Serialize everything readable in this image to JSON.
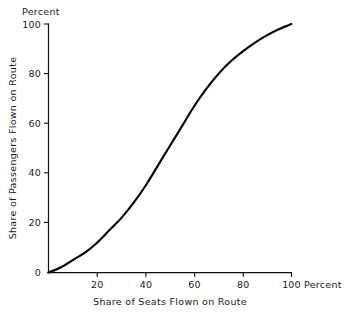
{
  "chart_data": {
    "type": "line",
    "title": "",
    "subtitle": "",
    "xlabel": "Share of Seats Flown on Route",
    "ylabel": "Share of Passengers Flown on Route",
    "x_unit_label": "Percent",
    "y_unit_label": "Percent",
    "xlim": [
      0,
      100
    ],
    "ylim": [
      0,
      100
    ],
    "grid": false,
    "legend": null,
    "legend_position": "none",
    "x_ticks": [
      0,
      20,
      40,
      60,
      80,
      100
    ],
    "x_tick_labels": [
      "",
      "20",
      "40",
      "60",
      "80",
      "100"
    ],
    "y_ticks": [
      0,
      20,
      40,
      60,
      80,
      100
    ],
    "y_tick_labels": [
      "0",
      "20",
      "40",
      "60",
      "80",
      "100"
    ],
    "origin_label": "0",
    "series": [
      {
        "name": "S-curve",
        "color": "#000000",
        "x": [
          0,
          5,
          10,
          15,
          20,
          25,
          30,
          35,
          40,
          45,
          50,
          55,
          60,
          65,
          70,
          75,
          80,
          85,
          90,
          95,
          100
        ],
        "values": [
          0,
          2,
          5,
          8,
          12,
          17,
          22,
          28,
          35,
          43,
          51,
          59,
          67,
          74,
          80,
          85,
          89,
          92.5,
          95.5,
          98,
          100
        ]
      }
    ],
    "annotations": []
  },
  "axes": {
    "y_unit": "Percent",
    "x_unit": "Percent",
    "x_title": "Share of Seats Flown on Route",
    "y_title": "Share of Passengers Flown on Route"
  },
  "ticks": {
    "y": [
      "100",
      "80",
      "60",
      "40",
      "20",
      "0"
    ],
    "x": [
      "20",
      "40",
      "60",
      "80",
      "100"
    ]
  }
}
